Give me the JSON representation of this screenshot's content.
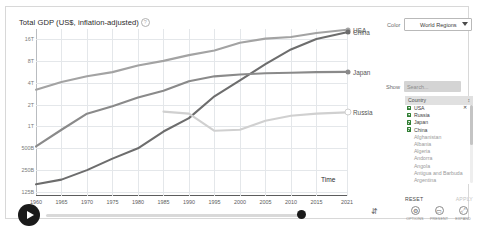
{
  "chart": {
    "title": "Total GDP (US$, inflation-adjusted)",
    "info_icon": "info-icon",
    "time_axis_label": "Time"
  },
  "chart_data": {
    "type": "line",
    "title": "Total GDP (US$, inflation-adjusted)",
    "xlabel": "Time",
    "ylabel": "",
    "y_scale": "log",
    "grid": true,
    "legend_position": "right-inline",
    "x": [
      1960,
      1965,
      1970,
      1975,
      1980,
      1985,
      1990,
      1995,
      2000,
      2005,
      2010,
      2015,
      2021
    ],
    "xticklabels": [
      "1960",
      "1965",
      "1970",
      "1975",
      "1980",
      "1985",
      "1990",
      "1995",
      "2000",
      "2005",
      "2010",
      "2015",
      "2021"
    ],
    "yticklabels": [
      "16T",
      "8T",
      "4T",
      "2T",
      "1T",
      "500B",
      "250B",
      "125B"
    ],
    "yticks": [
      16000,
      8000,
      4000,
      2000,
      1000,
      500,
      250,
      125
    ],
    "ylim": [
      110,
      22000
    ],
    "series": [
      {
        "name": "USA",
        "color": "#a3a3a3",
        "values": [
          3200,
          4100,
          4900,
          5600,
          6900,
          8000,
          9600,
          11100,
          14200,
          16200,
          17100,
          19400,
          21500
        ]
      },
      {
        "name": "China",
        "color": "#6d6d6d",
        "values": [
          160,
          185,
          250,
          360,
          500,
          850,
          1300,
          2600,
          4300,
          7200,
          11500,
          16000,
          19900
        ]
      },
      {
        "name": "Japan",
        "color": "#8a8a8a",
        "values": [
          530,
          900,
          1500,
          1900,
          2500,
          3100,
          4200,
          4900,
          5200,
          5400,
          5500,
          5600,
          5650
        ]
      },
      {
        "name": "Russia",
        "color": "#d0d0d0",
        "values": [
          null,
          null,
          null,
          null,
          null,
          1600,
          1500,
          870,
          900,
          1200,
          1400,
          1500,
          1560
        ]
      }
    ],
    "annotations": [
      {
        "label": "USA",
        "series": "USA"
      },
      {
        "label": "China",
        "series": "China"
      },
      {
        "label": "Japan",
        "series": "Japan"
      },
      {
        "label": "Russia",
        "series": "Russia"
      }
    ]
  },
  "controls": {
    "color_label": "Color",
    "color_value": "World Regions",
    "caret_icon": "chevron-down-icon",
    "show_label": "Show",
    "search_placeholder": "Search...",
    "search_icon": "search-icon"
  },
  "entity_panel": {
    "header": "Country",
    "sort_icon": "sort-caret-icon",
    "remove_icon": "close-icon",
    "items": [
      {
        "label": "USA",
        "checked": true,
        "removable": true
      },
      {
        "label": "Russia",
        "checked": true,
        "removable": false
      },
      {
        "label": "Japan",
        "checked": true,
        "removable": false
      },
      {
        "label": "China",
        "checked": true,
        "removable": false
      },
      {
        "label": "Afghanistan",
        "checked": false,
        "removable": false
      },
      {
        "label": "Albania",
        "checked": false,
        "removable": false
      },
      {
        "label": "Algeria",
        "checked": false,
        "removable": false
      },
      {
        "label": "Andorra",
        "checked": false,
        "removable": false
      },
      {
        "label": "Angola",
        "checked": false,
        "removable": false
      },
      {
        "label": "Antigua and Barbuda",
        "checked": false,
        "removable": false
      },
      {
        "label": "Argentina",
        "checked": false,
        "removable": false
      }
    ],
    "reset_label": "RESET",
    "apply_label": "APPLY"
  },
  "timeline": {
    "play_icon": "play-icon",
    "handle_name": "timeline-handle",
    "start_year": "1960",
    "end_year": "2021"
  },
  "footer": {
    "bookmark_icon": "bookmark-icon",
    "tools": [
      {
        "icon": "settings-icon",
        "glyph": "⚙",
        "label": "OPTIONS"
      },
      {
        "icon": "present-icon",
        "glyph": "▭",
        "label": "PRESENT"
      },
      {
        "icon": "expand-icon",
        "glyph": "⤢",
        "label": "EXPAND"
      }
    ]
  }
}
